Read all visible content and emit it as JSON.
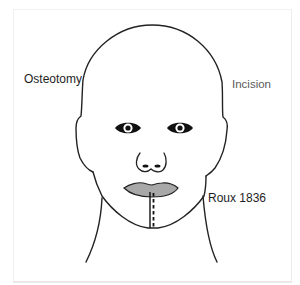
{
  "figure": {
    "labels": {
      "osteotomy": "Osteotomy",
      "incision": "Incision",
      "roux": "Roux 1836"
    },
    "colors": {
      "outline": "#222222",
      "lips_fill": "#a8a8a8",
      "incision_label": "#5a5a5a",
      "text": "#1e1e1e",
      "background": "#ffffff"
    },
    "features": [
      {
        "name": "head-outline",
        "style": "solid"
      },
      {
        "name": "left-eye",
        "style": "filled"
      },
      {
        "name": "right-eye",
        "style": "filled"
      },
      {
        "name": "nose",
        "style": "solid"
      },
      {
        "name": "lips",
        "style": "gray-filled"
      },
      {
        "name": "osteotomy-line",
        "style": "solid"
      },
      {
        "name": "incision-line",
        "style": "dashed"
      },
      {
        "name": "neck",
        "style": "solid"
      }
    ]
  }
}
